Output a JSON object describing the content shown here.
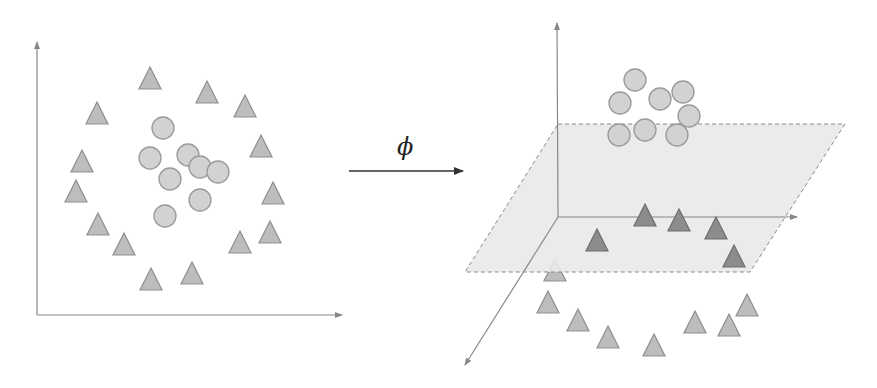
{
  "colors": {
    "axis": "#888888",
    "arrow": "#333333",
    "triangle_fill": "#bdbdbd",
    "triangle_stroke": "#8f8f8f",
    "triangle_dark_fill": "#8c8c8c",
    "triangle_dark_stroke": "#6e6e6e",
    "circle_fill": "#d2d2d2",
    "circle_stroke": "#9a9a9a",
    "plane_fill": "#e9e9e9",
    "plane_stroke": "#8a8a8a"
  },
  "mapping": {
    "label": "ϕ",
    "arrow": {
      "x1": 349,
      "y1": 171,
      "x2": 463,
      "y2": 171
    },
    "label_pos": {
      "x": 397,
      "y": 133
    }
  },
  "left_plot": {
    "axes": {
      "origin": [
        37,
        315
      ],
      "x_end": [
        342,
        315
      ],
      "y_end": [
        37,
        42
      ]
    },
    "triangles": [
      [
        150,
        78
      ],
      [
        207,
        92
      ],
      [
        245,
        106
      ],
      [
        97,
        113
      ],
      [
        261,
        146
      ],
      [
        82,
        161
      ],
      [
        76,
        191
      ],
      [
        273,
        193
      ],
      [
        98,
        224
      ],
      [
        270,
        232
      ],
      [
        124,
        244
      ],
      [
        240,
        242
      ],
      [
        151,
        279
      ],
      [
        192,
        273
      ]
    ],
    "circles": [
      [
        163,
        128
      ],
      [
        150,
        158
      ],
      [
        188,
        155
      ],
      [
        200,
        167
      ],
      [
        218,
        172
      ],
      [
        170,
        179
      ],
      [
        200,
        200
      ],
      [
        165,
        216
      ]
    ]
  },
  "right_plot": {
    "axes": {
      "origin": [
        558,
        217
      ],
      "x_end": [
        797,
        217
      ],
      "y_end": [
        557,
        23
      ],
      "z_end": [
        465,
        365
      ]
    },
    "plane": [
      [
        558,
        124
      ],
      [
        845,
        124
      ],
      [
        750,
        272
      ],
      [
        465,
        272
      ]
    ],
    "circles": [
      [
        635,
        80
      ],
      [
        620,
        103
      ],
      [
        660,
        99
      ],
      [
        683,
        92
      ],
      [
        689,
        116
      ],
      [
        619,
        135
      ],
      [
        645,
        130
      ],
      [
        677,
        135
      ]
    ],
    "triangles_on_plane": [
      [
        645,
        215
      ],
      [
        679,
        220
      ],
      [
        716,
        228
      ],
      [
        597,
        240
      ],
      [
        734,
        256
      ]
    ],
    "triangles_below": [
      [
        555,
        270
      ],
      [
        548,
        302
      ],
      [
        578,
        320
      ],
      [
        608,
        337
      ],
      [
        654,
        345
      ],
      [
        695,
        322
      ],
      [
        729,
        325
      ],
      [
        747,
        305
      ]
    ]
  }
}
